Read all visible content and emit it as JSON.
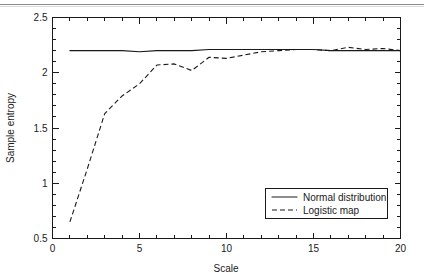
{
  "figure": {
    "background_color": "#ffffff",
    "foreground_color": "#1a1a1a",
    "top_rule_color": "#8b8b8b"
  },
  "axes": {
    "x_title": "Scale",
    "y_title": "Sample entropy",
    "x_ticks": [
      "0",
      "5",
      "10",
      "15",
      "20"
    ],
    "y_ticks": [
      "0.5",
      "1",
      "1.5",
      "2",
      "2.5"
    ]
  },
  "legend": {
    "items": [
      {
        "label": "Normal distribution",
        "style": "solid"
      },
      {
        "label": "Logistic map",
        "style": "dashed"
      }
    ]
  },
  "chart_data": {
    "type": "line",
    "title": "",
    "xlabel": "Scale",
    "ylabel": "Sample entropy",
    "xlim": [
      0,
      20
    ],
    "ylim": [
      0.5,
      2.5
    ],
    "xticks": [
      0,
      5,
      10,
      15,
      20
    ],
    "yticks": [
      0.5,
      1,
      1.5,
      2,
      2.5
    ],
    "xminor_step": 1,
    "yminor_step": 0.1,
    "grid": false,
    "legend_position": "lower right",
    "x": [
      1,
      2,
      3,
      4,
      5,
      6,
      7,
      8,
      9,
      10,
      11,
      12,
      13,
      14,
      15,
      16,
      17,
      18,
      19,
      20
    ],
    "series": [
      {
        "name": "Normal distribution",
        "style": "solid",
        "values": [
          2.2,
          2.2,
          2.2,
          2.2,
          2.19,
          2.2,
          2.2,
          2.2,
          2.21,
          2.21,
          2.21,
          2.21,
          2.21,
          2.21,
          2.21,
          2.2,
          2.2,
          2.2,
          2.2,
          2.2
        ]
      },
      {
        "name": "Logistic map",
        "style": "dashed",
        "values": [
          0.65,
          1.13,
          1.63,
          1.79,
          1.9,
          2.07,
          2.08,
          2.02,
          2.14,
          2.13,
          2.16,
          2.19,
          2.2,
          2.21,
          2.21,
          2.2,
          2.23,
          2.21,
          2.22,
          2.2
        ]
      }
    ]
  }
}
